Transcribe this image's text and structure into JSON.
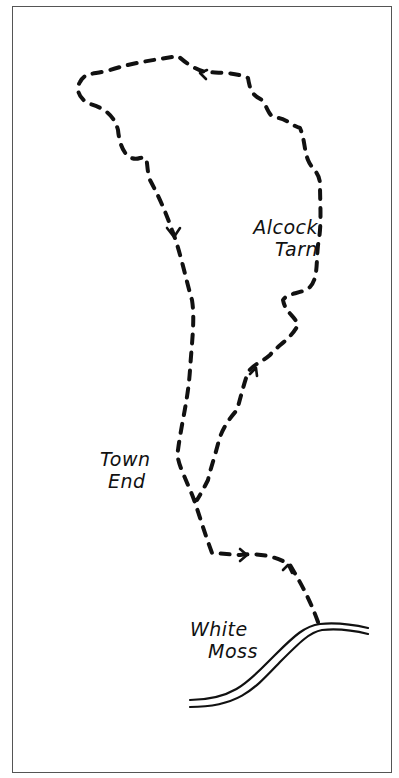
{
  "map": {
    "type": "hand-drawn walking route sketch map",
    "places": [
      {
        "name": "Alcock Tarn",
        "line1": "Alcock",
        "line2": "Tarn"
      },
      {
        "name": "Town End",
        "line1": "Town",
        "line2": "End"
      },
      {
        "name": "White Moss",
        "line1": "White",
        "line2": "Moss"
      }
    ],
    "legend": {
      "route": "dashed line",
      "road": "double line",
      "direction": "arrowheads"
    },
    "colors": {
      "ink": "#111111",
      "border": "#555555",
      "paper": "#ffffff"
    }
  }
}
